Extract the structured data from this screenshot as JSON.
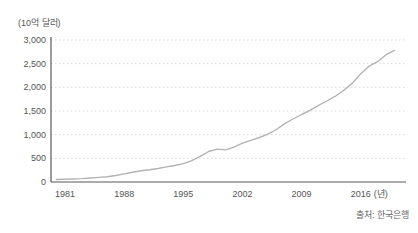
{
  "chart_data": {
    "type": "line",
    "title": "",
    "unit_label": "(10억 달러)",
    "ylabel": "10억 달러",
    "xlabel": "년",
    "x_tick_suffix": "(년)",
    "x_ticks": [
      "1981",
      "1988",
      "1995",
      "2002",
      "2009",
      "2016"
    ],
    "x_tick_years": [
      1981,
      1988,
      1995,
      2002,
      2009,
      2016
    ],
    "y_ticks": [
      {
        "value": 0,
        "label": "0"
      },
      {
        "value": 500,
        "label": "500"
      },
      {
        "value": 1000,
        "label": "1,000"
      },
      {
        "value": 1500,
        "label": "1,500"
      },
      {
        "value": 2000,
        "label": "2,000"
      },
      {
        "value": 2500,
        "label": "2,500"
      },
      {
        "value": 3000,
        "label": "3,000"
      }
    ],
    "ylim": [
      0,
      3000
    ],
    "xlim": [
      1980,
      2020
    ],
    "grid": "horizontal-dotted",
    "legend": "none",
    "x": [
      1980,
      1981,
      1982,
      1983,
      1984,
      1985,
      1986,
      1987,
      1988,
      1989,
      1990,
      1991,
      1992,
      1993,
      1994,
      1995,
      1996,
      1997,
      1998,
      1999,
      2000,
      2001,
      2002,
      2003,
      2004,
      2005,
      2006,
      2007,
      2008,
      2009,
      2010,
      2011,
      2012,
      2013,
      2014,
      2015,
      2016,
      2017,
      2018,
      2019,
      2020
    ],
    "series": [
      {
        "name": "usd-billions",
        "values": [
          52,
          58,
          64,
          72,
          85,
          98,
          113,
          138,
          172,
          207,
          238,
          260,
          285,
          318,
          348,
          388,
          450,
          540,
          645,
          695,
          678,
          738,
          820,
          882,
          940,
          1012,
          1110,
          1232,
          1330,
          1425,
          1512,
          1620,
          1712,
          1812,
          1940,
          2090,
          2288,
          2448,
          2542,
          2690,
          2782
        ]
      }
    ],
    "colors": {
      "line": "#b3b3b3",
      "axis": "#595959",
      "grid": "#d6d6d6",
      "text": "#555555"
    }
  },
  "source": {
    "text": "출처: 한국은행"
  }
}
